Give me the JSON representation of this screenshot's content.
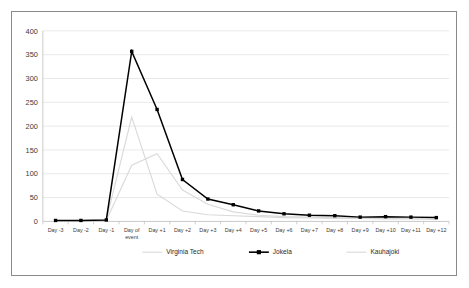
{
  "chart_data": {
    "type": "line",
    "title": "",
    "subtitle": "",
    "xlabel": "",
    "ylabel": "",
    "ylim": [
      0,
      400
    ],
    "ytick_step": 50,
    "yticks": [
      "0",
      "50",
      "100",
      "150",
      "200",
      "250",
      "300",
      "350",
      "400"
    ],
    "grid": true,
    "legend_position": "bottom",
    "categories": [
      "Day -3",
      "Day -2",
      "Day -1",
      "Day of event",
      "Day +1",
      "Day +2",
      "Day +3",
      "Day +4",
      "Day +5",
      "Day +6",
      "Day +7",
      "Day +8",
      "Day +9",
      "Day +10",
      "Day +11",
      "Day +12"
    ],
    "series": [
      {
        "name": "Virginia Tech",
        "color": "#d9d9d9",
        "marker": "none",
        "values": [
          1,
          1,
          3,
          219,
          57,
          22,
          14,
          12,
          10,
          8,
          7,
          6,
          6,
          5,
          5,
          4
        ]
      },
      {
        "name": "Jokela",
        "color": "#000000",
        "marker": "square",
        "values": [
          2,
          2,
          3,
          357,
          235,
          88,
          47,
          35,
          22,
          16,
          13,
          12,
          9,
          10,
          9,
          8
        ]
      },
      {
        "name": "Kauhajoki",
        "color": "#d9d9d9",
        "marker": "none",
        "values": [
          1,
          1,
          2,
          118,
          142,
          66,
          36,
          20,
          13,
          10,
          9,
          8,
          7,
          6,
          6,
          5
        ]
      }
    ]
  },
  "legend": {
    "entries": [
      {
        "label": "Virginia Tech",
        "color": "#d9d9d9",
        "marker": "none"
      },
      {
        "label": "Jokela",
        "color": "#000000",
        "marker": "square"
      },
      {
        "label": "Kauhajoki",
        "color": "#d9d9d9",
        "marker": "none"
      }
    ]
  },
  "colors": {
    "frame_border": "#8a8a8a",
    "gridline": "#d6d6d6",
    "axis": "#b2b2b2",
    "text": "#3a3a3a",
    "background": "#ffffff",
    "highlight_series": "#000000",
    "muted_series": "#d9d9d9"
  }
}
